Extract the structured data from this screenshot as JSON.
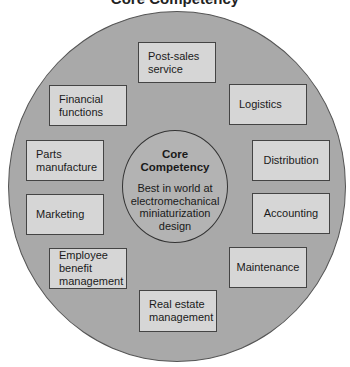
{
  "title": "Core Competency",
  "center": {
    "heading_line1": "Core",
    "heading_line2": "Competency",
    "description": "Best in world at electromechanical miniaturization design"
  },
  "activities": [
    {
      "id": "post-sales-service",
      "label": "Post-sales\nservice"
    },
    {
      "id": "logistics",
      "label": "Logistics"
    },
    {
      "id": "distribution",
      "label": "Distribution"
    },
    {
      "id": "accounting",
      "label": "Accounting"
    },
    {
      "id": "maintenance",
      "label": "Maintenance"
    },
    {
      "id": "real-estate-management",
      "label": "Real estate\nmanagement"
    },
    {
      "id": "employee-benefit-management",
      "label": "Employee\nbenefit\nmanagement"
    },
    {
      "id": "marketing",
      "label": "Marketing"
    },
    {
      "id": "parts-manufacture",
      "label": "Parts\nmanufacture"
    },
    {
      "id": "financial-functions",
      "label": "Financial\nfunctions"
    }
  ],
  "colors": {
    "outer_circle": "#a9a9a9",
    "inner_circle": "#b3b3b3",
    "box_fill": "#d6d6d6",
    "stroke": "#444444"
  }
}
